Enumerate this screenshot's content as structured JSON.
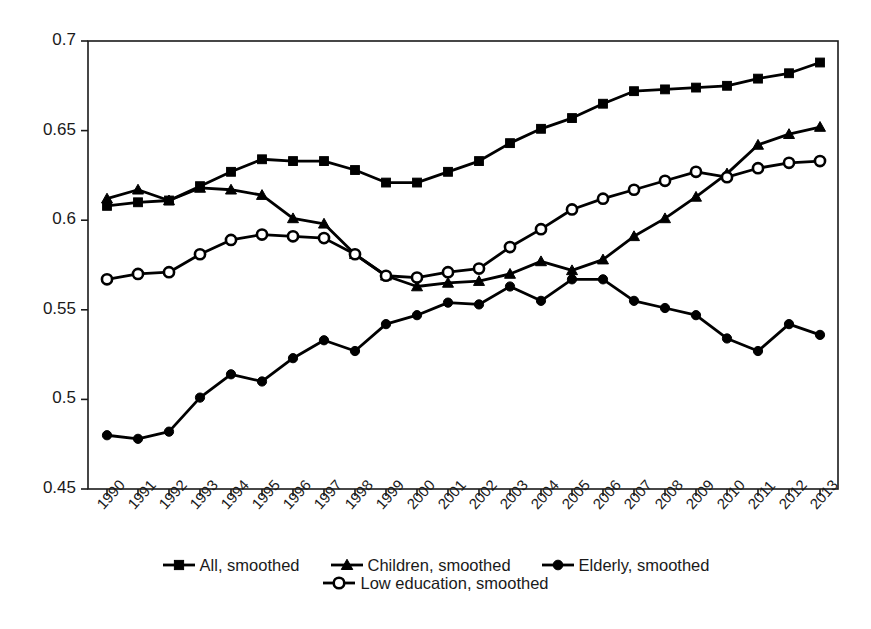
{
  "chart_data": {
    "type": "line",
    "title": "",
    "subtitle": "",
    "xlabel": "",
    "ylabel": "",
    "grid": false,
    "legend_position": "bottom",
    "x": [
      "1990",
      "1991",
      "1992",
      "1993",
      "1994",
      "1995",
      "1996",
      "1997",
      "1998",
      "1999",
      "2000",
      "2001",
      "2002",
      "2003",
      "2004",
      "2005",
      "2006",
      "2007",
      "2008",
      "2009",
      "2010",
      "2011",
      "2012",
      "2013"
    ],
    "categories": [
      "1990",
      "1991",
      "1992",
      "1993",
      "1994",
      "1995",
      "1996",
      "1997",
      "1998",
      "1999",
      "2000",
      "2001",
      "2002",
      "2003",
      "2004",
      "2005",
      "2006",
      "2007",
      "2008",
      "2009",
      "2010",
      "2011",
      "2012",
      "2013"
    ],
    "xlim": [
      1990,
      2013
    ],
    "ylim": [
      0.45,
      0.7
    ],
    "ytick_labels": [
      "0.7",
      "0.65",
      "0.6",
      "0.55",
      "0.5",
      "0.45"
    ],
    "ytick_values": [
      0.7,
      0.65,
      0.6,
      0.55,
      0.5,
      0.45
    ],
    "series": [
      {
        "name": "All, smoothed",
        "marker": "filled-square",
        "color": "#000000",
        "values": [
          0.608,
          0.61,
          0.611,
          0.619,
          0.627,
          0.634,
          0.633,
          0.633,
          0.628,
          0.621,
          0.621,
          0.627,
          0.633,
          0.643,
          0.651,
          0.657,
          0.665,
          0.672,
          0.673,
          0.674,
          0.675,
          0.679,
          0.682,
          0.688
        ]
      },
      {
        "name": "Children, smoothed",
        "marker": "filled-triangle",
        "color": "#000000",
        "values": [
          0.612,
          0.617,
          0.611,
          0.618,
          0.617,
          0.614,
          0.601,
          0.598,
          0.581,
          0.569,
          0.563,
          0.565,
          0.566,
          0.57,
          0.577,
          0.572,
          0.578,
          0.591,
          0.601,
          0.613,
          0.626,
          0.642,
          0.648,
          0.652
        ]
      },
      {
        "name": "Elderly, smoothed",
        "marker": "filled-circle",
        "color": "#000000",
        "values": [
          0.48,
          0.478,
          0.482,
          0.501,
          0.514,
          0.51,
          0.523,
          0.533,
          0.527,
          0.542,
          0.547,
          0.554,
          0.553,
          0.563,
          0.555,
          0.567,
          0.567,
          0.555,
          0.551,
          0.547,
          0.534,
          0.527,
          0.542,
          0.536
        ]
      },
      {
        "name": "Low education, smoothed",
        "marker": "open-circle",
        "color": "#000000",
        "values": [
          0.567,
          0.57,
          0.571,
          0.581,
          0.589,
          0.592,
          0.591,
          0.59,
          0.581,
          0.569,
          0.568,
          0.571,
          0.573,
          0.585,
          0.595,
          0.606,
          0.612,
          0.617,
          0.622,
          0.627,
          0.624,
          0.629,
          0.632,
          0.633
        ]
      }
    ]
  },
  "legend": {
    "rows": [
      [
        {
          "label": "All, smoothed",
          "marker": "filled-square"
        },
        {
          "label": "Children, smoothed",
          "marker": "filled-triangle"
        },
        {
          "label": "Elderly, smoothed",
          "marker": "filled-circle"
        }
      ],
      [
        {
          "label": "Low education, smoothed",
          "marker": "open-circle"
        }
      ]
    ]
  }
}
